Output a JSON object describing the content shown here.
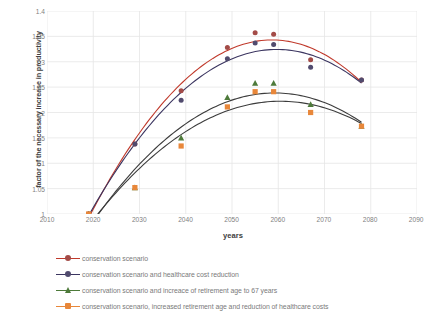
{
  "chart_data": {
    "type": "scatter",
    "title": "",
    "xlabel": "years",
    "ylabel": "factor of the necessary increase in productivity",
    "xlim": [
      2010,
      2090
    ],
    "ylim": [
      1,
      1.4
    ],
    "xticks": [
      2010,
      2020,
      2030,
      2040,
      2050,
      2060,
      2070,
      2080,
      2090
    ],
    "yticks": [
      "1",
      "1.05",
      "1.1",
      "1.15",
      "1.2",
      "1.25",
      "1.3",
      "1.35",
      "1.4"
    ],
    "grid": true,
    "legend_position": "bottom",
    "series": [
      {
        "name": "conservation scenario",
        "color": "#A34B47",
        "line_color": "#C0392B",
        "marker": "circle",
        "x": [
          2019,
          2029,
          2039,
          2049,
          2055,
          2059,
          2067,
          2078
        ],
        "y": [
          1.0,
          1.138,
          1.243,
          1.328,
          1.357,
          1.354,
          1.304,
          1.264
        ],
        "trend": "polynomial order 2"
      },
      {
        "name": "conservation scenario and healthcare cost reduction",
        "color": "#514B6E",
        "line_color": "#3B3560",
        "marker": "circle",
        "x": [
          2019,
          2029,
          2039,
          2049,
          2055,
          2059,
          2067,
          2078
        ],
        "y": [
          1.0,
          1.138,
          1.224,
          1.306,
          1.337,
          1.334,
          1.289,
          1.264
        ],
        "trend": "polynomial order 2"
      },
      {
        "name": "conservation scenario and increace of retirement age to 67 years",
        "color": "#4D7A3A",
        "line_color": "#3C3C3C",
        "marker": "triangle",
        "x": [
          2019,
          2029,
          2039,
          2049,
          2055,
          2059,
          2067,
          2078
        ],
        "y": [
          1.0,
          1.052,
          1.15,
          1.23,
          1.258,
          1.258,
          1.216,
          1.173
        ],
        "trend": "polynomial order 2"
      },
      {
        "name": "conservation scenario, increased retirement age and reduction of healthcare costs",
        "color": "#E8873A",
        "line_color": "#3C3C3C",
        "marker": "square",
        "x": [
          2019,
          2029,
          2039,
          2049,
          2055,
          2059,
          2067,
          2078
        ],
        "y": [
          1.0,
          1.052,
          1.134,
          1.211,
          1.241,
          1.241,
          1.2,
          1.173
        ],
        "trend": "polynomial order 2"
      }
    ]
  },
  "axes": {
    "x_title": "years",
    "y_title": "factor of the necessary increase in productivity"
  },
  "legend": {
    "items": [
      {
        "label": "conservation scenario",
        "line_color": "#C0392B",
        "marker_color": "#A34B47",
        "marker": "circle"
      },
      {
        "label": "conservation scenario and healthcare cost reduction",
        "line_color": "#3B3560",
        "marker_color": "#514B6E",
        "marker": "circle"
      },
      {
        "label": "conservation scenario and increace of retirement age to 67 years",
        "line_color": "#4D7A3A",
        "marker_color": "#4D7A3A",
        "marker": "triangle"
      },
      {
        "label": "conservation scenario, increased retirement age and reduction of healthcare costs",
        "line_color": "#E8873A",
        "marker_color": "#E8873A",
        "marker": "square"
      }
    ]
  },
  "colors": {
    "grid": "#E6E6E6",
    "axis_text": "#7f7f7f",
    "title_text": "#404040",
    "background": "#ffffff"
  }
}
